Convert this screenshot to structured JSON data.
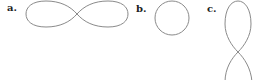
{
  "panels": [
    {
      "label": "a.",
      "shape": "horizontal-lemniscate"
    },
    {
      "label": "b.",
      "shape": "circle"
    },
    {
      "label": "c.",
      "shape": "vertical-figure-eight"
    }
  ],
  "colors": {
    "stroke": "#8a8a8a",
    "label": "#222222",
    "background": "#ffffff"
  }
}
